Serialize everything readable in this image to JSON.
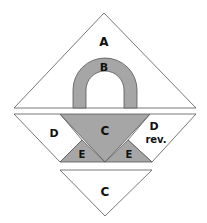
{
  "diagram": {
    "type": "quilt-block-pattern",
    "pieces": {
      "A": {
        "label": "A",
        "fill": "#ffffff"
      },
      "B": {
        "label": "B",
        "fill": "#a6a6a6"
      },
      "C_top": {
        "label": "C",
        "fill": "#a6a6a6"
      },
      "C_bottom": {
        "label": "C",
        "fill": "#ffffff"
      },
      "D": {
        "label": "D",
        "fill": "#ffffff"
      },
      "D_rev": {
        "label": "D",
        "label2": "rev.",
        "fill": "#ffffff"
      },
      "E_left": {
        "label": "E",
        "fill": "#a6a6a6"
      },
      "E_right": {
        "label": "E",
        "fill": "#a6a6a6"
      }
    },
    "colors": {
      "stroke": "#555555",
      "gray": "#a6a6a6",
      "white": "#ffffff"
    }
  }
}
